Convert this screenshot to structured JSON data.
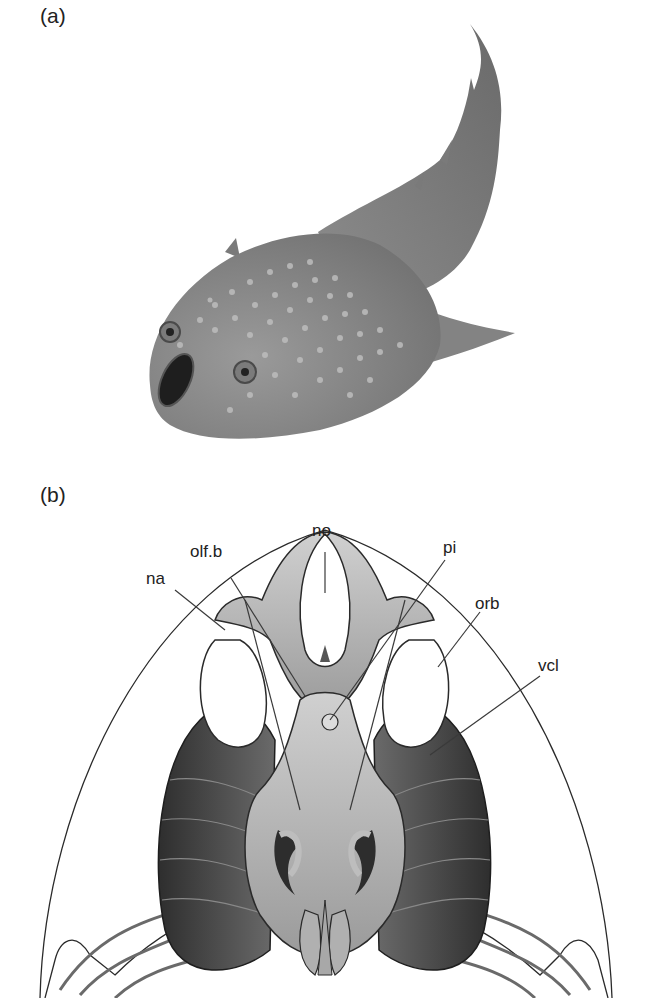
{
  "figure": {
    "panel_a": {
      "label": "(a)",
      "subject": "fish-illustration"
    },
    "panel_b": {
      "label": "(b)",
      "subject": "head-shield-internal-anatomy",
      "annotations": [
        {
          "id": "no",
          "text": "no"
        },
        {
          "id": "olf_b",
          "text": "olf.b"
        },
        {
          "id": "pi",
          "text": "pi"
        },
        {
          "id": "na",
          "text": "na"
        },
        {
          "id": "orb",
          "text": "orb"
        },
        {
          "id": "vcl",
          "text": "vcl"
        }
      ]
    }
  },
  "colors": {
    "background": "#ffffff",
    "fish_body": "#8a8a8a",
    "fish_spots": "#b9b9b9",
    "anatomy_dark": "#3c3c3c",
    "anatomy_light": "#c4c4c4",
    "outline": "#2a2a2a"
  }
}
